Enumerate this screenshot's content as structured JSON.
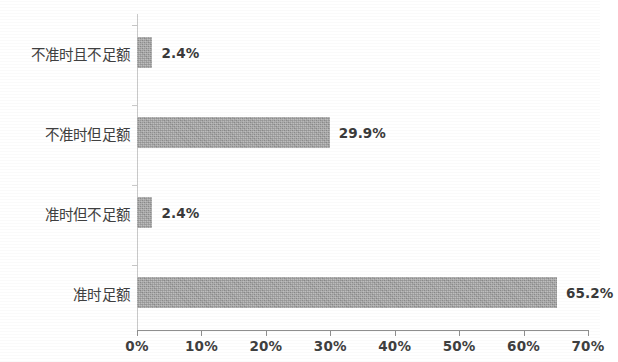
{
  "chart_data": {
    "type": "bar",
    "orientation": "horizontal",
    "title": "",
    "subtitle": "",
    "xlabel": "",
    "ylabel": "",
    "categories": [
      "不准时且不足额",
      "不准时但足额",
      "准时但不足额",
      "准时足额"
    ],
    "values": [
      2.4,
      29.9,
      2.4,
      65.2
    ],
    "value_labels": [
      "2.4%",
      "29.9%",
      "2.4%",
      "65.2%"
    ],
    "xlim": [
      0,
      70
    ],
    "xticks": [
      0,
      10,
      20,
      30,
      40,
      50,
      60,
      70
    ],
    "xtick_labels": [
      "0%",
      "10%",
      "20%",
      "30%",
      "40%",
      "50%",
      "60%",
      "70%"
    ],
    "grid": false,
    "legend": null,
    "bar_color": "#9d9d9d",
    "axis_color": "#8f8f8f",
    "text_color": "#3b3b3b"
  }
}
